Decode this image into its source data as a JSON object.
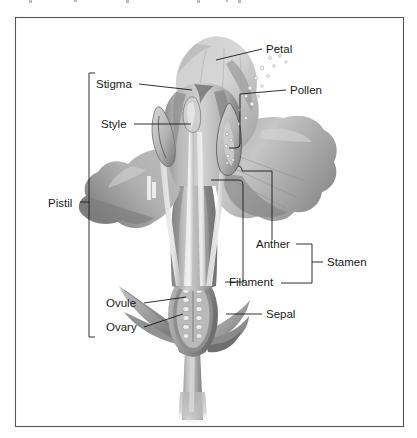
{
  "figure": {
    "kind": "botanical-diagram",
    "palette": {
      "background": "#ffffff",
      "frame_stroke": "#555555",
      "leader_stroke": "#1a1a1a",
      "label_text": "#1a1a1a",
      "petal_light": "#d9d9d9",
      "petal_mid": "#b4b4b4",
      "petal_dark": "#8a8a8a",
      "petal_shadow": "#6e6e6e",
      "stem_light": "#cfcfcf",
      "stem_mid": "#9a9a9a",
      "stem_dark": "#6f6f6f",
      "ovary_fill": "#9d9d9d",
      "ovule_fill": "#e6e6e6",
      "pollen_fill": "#efefef"
    },
    "frame": {
      "x": 15,
      "y": 17,
      "width": 389,
      "height": 410
    }
  },
  "labels": {
    "petal": {
      "text": "Petal",
      "x": 266,
      "y": 53
    },
    "stigma": {
      "text": "Stigma",
      "x": 96,
      "y": 88
    },
    "pollen": {
      "text": "Pollen",
      "x": 290,
      "y": 94
    },
    "style": {
      "text": "Style",
      "x": 101,
      "y": 128
    },
    "pistil": {
      "text": "Pistil",
      "x": 48,
      "y": 207
    },
    "anther": {
      "text": "Anther",
      "x": 256,
      "y": 248
    },
    "stamen": {
      "text": "Stamen",
      "x": 327,
      "y": 265
    },
    "filament": {
      "text": "Filament",
      "x": 229,
      "y": 285
    },
    "ovule": {
      "text": "Ovule",
      "x": 106,
      "y": 307
    },
    "sepal": {
      "text": "Sepal",
      "x": 266,
      "y": 318
    },
    "ovary": {
      "text": "Ovary",
      "x": 106,
      "y": 331
    }
  },
  "brackets": {
    "pistil": {
      "top_y": 73,
      "bottom_y": 337,
      "x": 89,
      "tick_y": 202,
      "tick_x_end": 80
    },
    "stamen": {
      "top_y": 244,
      "bottom_y": 283,
      "x": 312,
      "tick_y": 262,
      "tick_x_end": 322
    }
  }
}
